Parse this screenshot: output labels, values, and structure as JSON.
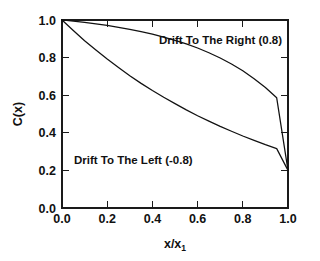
{
  "figure": {
    "background_color": "#ffffff",
    "line_color": "#111111",
    "frame_color": "#1a1a1a"
  },
  "chart_data": {
    "type": "line",
    "title": "",
    "subtitle": "",
    "xlabel": "x/x",
    "xlabel_subscript": "1",
    "ylabel": "C(x)",
    "xlim": [
      0.0,
      1.0
    ],
    "ylim": [
      0.0,
      1.0
    ],
    "grid": false,
    "legend": "none",
    "xticks": [
      "0.0",
      "0.2",
      "0.4",
      "0.6",
      "0.8",
      "1.0"
    ],
    "xtick_values": [
      0.0,
      0.2,
      0.4,
      0.6,
      0.8,
      1.0
    ],
    "yticks": [
      "0.0",
      "0.2",
      "0.4",
      "0.6",
      "0.8",
      "1.0"
    ],
    "ytick_values": [
      0.0,
      0.2,
      0.4,
      0.6,
      0.8,
      1.0
    ],
    "x": [
      0.0,
      0.05,
      0.1,
      0.15,
      0.2,
      0.25,
      0.3,
      0.35,
      0.4,
      0.45,
      0.5,
      0.55,
      0.6,
      0.65,
      0.7,
      0.75,
      0.8,
      0.85,
      0.9,
      0.95,
      1.0
    ],
    "series": [
      {
        "name": "Drift To The Right (0.8)",
        "peclet": 0.8,
        "boundary_left": 1.0,
        "boundary_right": 0.2,
        "values": [
          1.0,
          0.994,
          0.987,
          0.979,
          0.971,
          0.961,
          0.95,
          0.938,
          0.925,
          0.909,
          0.892,
          0.873,
          0.851,
          0.826,
          0.798,
          0.766,
          0.73,
          0.688,
          0.641,
          0.586,
          0.2
        ]
      },
      {
        "name": "Drift To The Left (-0.8)",
        "peclet": -0.8,
        "boundary_left": 1.0,
        "boundary_right": 0.2,
        "values": [
          1.0,
          0.944,
          0.89,
          0.84,
          0.792,
          0.747,
          0.704,
          0.663,
          0.625,
          0.589,
          0.555,
          0.522,
          0.491,
          0.462,
          0.434,
          0.408,
          0.383,
          0.36,
          0.337,
          0.316,
          0.2
        ]
      }
    ],
    "annotations": [
      {
        "id": "drift-right-label",
        "text": "Drift To The Right (0.8)",
        "x": 0.43,
        "y": 0.905
      },
      {
        "id": "drift-left-label",
        "text": "Drift To The Left (-0.8)",
        "x": 0.09,
        "y": 0.265
      }
    ]
  }
}
